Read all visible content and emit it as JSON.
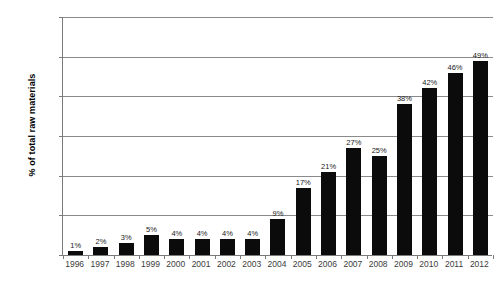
{
  "chart_data": {
    "type": "bar",
    "title": "",
    "xlabel": "",
    "ylabel": "% of total raw materials",
    "categories": [
      "1996",
      "1997",
      "1998",
      "1999",
      "2000",
      "2001",
      "2002",
      "2003",
      "2004",
      "2005",
      "2006",
      "2007",
      "2008",
      "2009",
      "2010",
      "2011",
      "2012"
    ],
    "values": [
      1,
      2,
      3,
      5,
      4,
      4,
      4,
      4,
      9,
      17,
      21,
      27,
      25,
      38,
      42,
      46,
      49
    ],
    "value_labels": [
      "1%",
      "2%",
      "3%",
      "5%",
      "4%",
      "4%",
      "4%",
      "4%",
      "9%",
      "17%",
      "21%",
      "27%",
      "25%",
      "38%",
      "42%",
      "46%",
      "49%"
    ],
    "ylim": [
      0,
      60
    ],
    "ytick_values": [
      0,
      10,
      20,
      30,
      40,
      50,
      60
    ],
    "ytick_labels": [
      "0%",
      "10%",
      "20%",
      "30%",
      "40%",
      "50%",
      "60%"
    ],
    "grid": true,
    "legend": false,
    "series_color": "#0b0b0b",
    "gridline_color": "#8a8a8a",
    "axis_color": "#7a7a7a",
    "background_color": "#ffffff"
  }
}
